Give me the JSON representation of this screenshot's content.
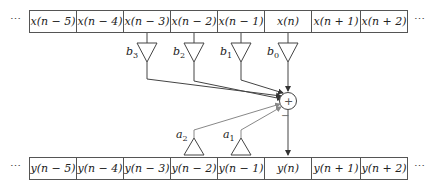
{
  "diagram": {
    "type": "IIR filter signal flow (direct form)",
    "input_row": {
      "ellipsis_left": "⋯",
      "ellipsis_right": "⋯",
      "cells": [
        "x(n − 5)",
        "x(n − 4)",
        "x(n − 3)",
        "x(n − 2)",
        "x(n − 1)",
        "x(n)",
        "x(n + 1)",
        "x(n + 2)"
      ]
    },
    "output_row": {
      "ellipsis_left": "⋯",
      "ellipsis_right": "⋯",
      "cells": [
        "y(n − 5)",
        "y(n − 4)",
        "y(n − 3)",
        "y(n − 2)",
        "y(n − 1)",
        "y(n)",
        "y(n + 1)",
        "y(n + 2)"
      ]
    },
    "feedforward_gains": [
      {
        "name": "b",
        "sub": "3",
        "source": "x(n − 3)"
      },
      {
        "name": "b",
        "sub": "2",
        "source": "x(n − 2)"
      },
      {
        "name": "b",
        "sub": "1",
        "source": "x(n − 1)"
      },
      {
        "name": "b",
        "sub": "0",
        "source": "x(n)"
      }
    ],
    "feedback_gains": [
      {
        "name": "a",
        "sub": "2",
        "source": "y(n − 2)"
      },
      {
        "name": "a",
        "sub": "1",
        "source": "y(n − 1)"
      }
    ],
    "summer": {
      "symbol": "+",
      "minus_sign": "−"
    },
    "colors": {
      "line": "#444444",
      "feedback_line": "#888888",
      "border": "#555555"
    }
  }
}
